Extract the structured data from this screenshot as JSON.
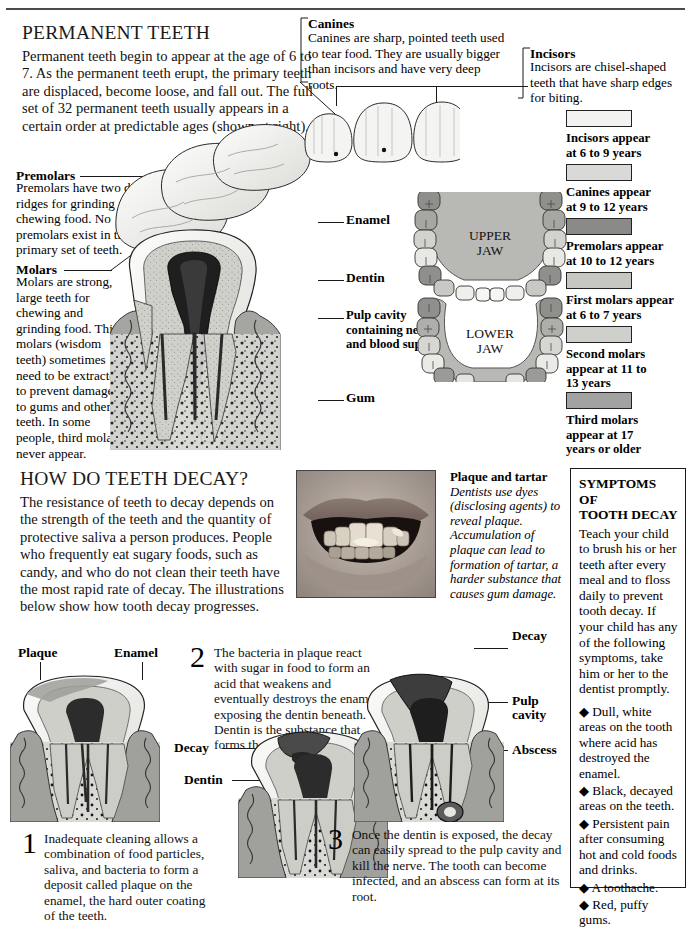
{
  "page": {
    "width": 691,
    "height": 917,
    "background": "#ffffff"
  },
  "section_permanent": {
    "heading": "PERMANENT TEETH",
    "intro": "Permanent teeth begin to appear at the age of 6 to 7. As the permanent teeth erupt, the primary teeth are displaced, become loose, and fall out. The full set of 32 permanent teeth usually appears in a certain order at predictable ages (shown at right).",
    "callouts": [
      {
        "title": "Premolars",
        "text": "Premolars have two distinct ridges for grinding and chewing food. No premolars exist in the primary set of teeth."
      },
      {
        "title": "Molars",
        "text": "Molars are strong, large teeth for chewing and grinding food. Third molars (wisdom teeth) sometimes need to be extracted to prevent damage to gums and other teeth. In some people, third molars never appear."
      },
      {
        "title": "Canines",
        "text": "Canines are sharp, pointed teeth used to tear food. They are usually bigger than incisors and have very deep roots."
      },
      {
        "title": "Incisors",
        "text": "Incisors are chisel-shaped teeth that have sharp edges for biting."
      }
    ],
    "tooth_labels": [
      "Enamel",
      "Dentin",
      "Pulp cavity containing nerves and blood supply",
      "Gum"
    ],
    "jaw_labels": {
      "upper": "UPPER JAW",
      "upper_line1": "UPPER",
      "upper_line2": "JAW",
      "lower": "LOWER JAW",
      "lower_line1": "LOWER",
      "lower_line2": "JAW"
    },
    "eruption_legend": [
      {
        "label": "Incisors appear at 6 to 9 years",
        "line1": "Incisors appear",
        "line2": "at 6 to 9 years",
        "color": "#f2f2f0"
      },
      {
        "label": "Canines appear at 9 to 12 years",
        "line1": "Canines appear",
        "line2": "at 9 to 12 years",
        "color": "#d9d9d7"
      },
      {
        "label": "Premolars appear at 10 to 12 years",
        "line1": "Premolars appear",
        "line2": "at 10 to 12 years",
        "color": "#8a8a88"
      },
      {
        "label": "First molars appear at 6 to 7 years",
        "line1": "First molars appear",
        "line2": "at 6 to 7 years",
        "color": "#c6c6c3"
      },
      {
        "label": "Second molars appear at 11 to 13 years",
        "line1": "Second molars",
        "line2": "appear at 11 to",
        "line3": "13 years",
        "color": "#cfcfcc"
      },
      {
        "label": "Third molars appear at 17 years or older",
        "line1": "Third molars",
        "line2": "appear at 17",
        "line3": "years or older",
        "color": "#a2a2a0"
      }
    ]
  },
  "section_decay": {
    "heading": "HOW DO TEETH DECAY?",
    "intro": "The resistance of teeth to decay depends on the strength of the teeth and the quantity of protective saliva a person produces. People who frequently eat sugary foods, such as candy, and who do not clean their teeth have the most rapid rate of decay. The illustrations below show how tooth decay progresses.",
    "photo_caption": {
      "title": "Plaque and tartar",
      "text": "Dentists use dyes (disclosing agents) to reveal plaque. Accumulation of plaque can lead to formation of tartar, a harder substance that causes gum damage."
    },
    "photo_alt": "close-up photograph of a child's mouth showing plaque on the teeth"
  },
  "symptoms": {
    "title_line1": "SYMPTOMS OF",
    "title_line2": "TOOTH DECAY",
    "title": "SYMPTOMS OF TOOTH DECAY",
    "body": "Teach your child to brush his or her teeth after every meal and to floss daily to prevent tooth decay. If your child has any of the following symptoms, take him or her to the dentist promptly.",
    "bullet_glyph": "◆",
    "items": [
      "Dull, white areas on the tooth where acid has destroyed the enamel.",
      "Black, decayed areas on the teeth.",
      "Persistent pain after consuming hot and cold foods and drinks.",
      "A toothache.",
      "Red, puffy gums."
    ]
  },
  "decay_steps": [
    {
      "number": "1",
      "text": "Inadequate cleaning allows a combination of food particles, saliva, and bacteria to form a deposit called plaque on the enamel, the hard outer coating of the teeth.",
      "labels": [
        "Plaque",
        "Enamel"
      ]
    },
    {
      "number": "2",
      "text": "The bacteria in plaque react with sugar in food to form an acid that weakens and eventually destroys the enamel, exposing the dentin beneath. Dentin is the substance that forms the bulk of a tooth.",
      "labels": [
        "Decay",
        "Dentin"
      ]
    },
    {
      "number": "3",
      "text": "Once the dentin is exposed, the decay can easily spread to the pulp cavity and kill the nerve. The tooth can become infected, and an abscess can form at its root.",
      "labels": [
        "Decay",
        "Pulp cavity",
        "Abscess"
      ]
    }
  ],
  "colors": {
    "ink": "#111111",
    "rule": "#1a1a1a",
    "enamel": "#e8e8e6",
    "dentin": "#c9c9c5",
    "pulp": "#2e2e2e",
    "gum": "#9a9a97",
    "bone": "#d4d4d0"
  }
}
